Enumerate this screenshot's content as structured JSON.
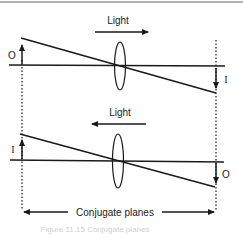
{
  "diagram": {
    "colors": {
      "ink": "#1a1a1a",
      "top_border": "#9a9a9a",
      "caption": "#d0d0d0"
    },
    "top_panel": {
      "direction_label": "Light",
      "direction": "left-to-right",
      "left_label": "O",
      "right_label": "I",
      "left_arrow": "up",
      "right_arrow": "down"
    },
    "bottom_panel": {
      "direction_label": "Light",
      "direction": "right-to-left",
      "left_label": "I",
      "right_label": "O",
      "left_arrow": "up",
      "right_arrow": "down"
    },
    "dimension_label": "Conjugate planes",
    "caption": "Figure 11.15 Conjugate planes"
  }
}
